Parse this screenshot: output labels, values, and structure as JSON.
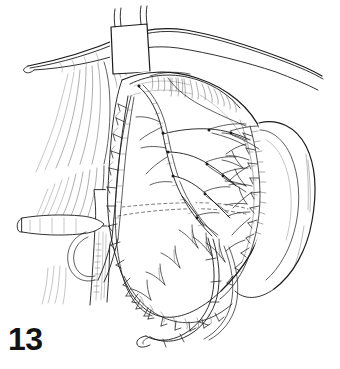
{
  "figure": {
    "number_label": "13",
    "caption": "",
    "kind": "surgical-line-art-illustration",
    "background_color": "#ffffff",
    "ink_color": "#1a1a1a",
    "shade_color": "#4a4a4a",
    "width_px": 340,
    "height_px": 369
  },
  "illustration": {
    "title": "",
    "elements": [
      {
        "name": "upper-tissue-band",
        "label": "upper transverse tissue band"
      },
      {
        "name": "vessel-tape",
        "label": "white vessel tape / encircling band"
      },
      {
        "name": "main-tissue-flap",
        "label": "central sutured tissue mass"
      },
      {
        "name": "branching-vessels",
        "label": "branching vascular tree"
      },
      {
        "name": "suture-line-left",
        "label": "left running suture line"
      },
      {
        "name": "suture-line-right",
        "label": "right running suture line"
      },
      {
        "name": "suture-line-inferior",
        "label": "inferior running suture line"
      },
      {
        "name": "lateral-lobe",
        "label": "right lateral lobe"
      },
      {
        "name": "left-vessel-trunk",
        "label": "left vertical vessel trunk"
      },
      {
        "name": "cross-vessel",
        "label": "horizontal crossing vessel"
      },
      {
        "name": "dashed-guideline",
        "label": "dashed internal guideline"
      },
      {
        "name": "hatched-shading",
        "label": "hatched shading strokes"
      }
    ]
  }
}
